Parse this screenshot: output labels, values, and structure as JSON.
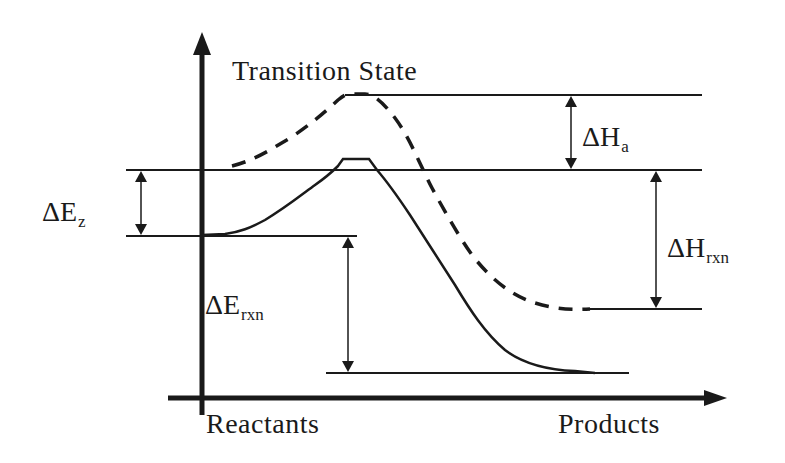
{
  "diagram": {
    "type": "energy-profile",
    "title_label": "Transition State",
    "x_axis": {
      "start_label": "Reactants",
      "end_label": "Products"
    },
    "labels": {
      "delta_e_z": {
        "base": "ΔE",
        "sub": "z"
      },
      "delta_h_a": {
        "base": "ΔH",
        "sub": "a"
      },
      "delta_h_rxn": {
        "base": "ΔH",
        "sub": "rxn"
      },
      "delta_e_rxn": {
        "base": "ΔE",
        "sub": "rxn"
      }
    },
    "curves": [
      {
        "name": "enthalpy-curve",
        "style": "dashed"
      },
      {
        "name": "energy-curve",
        "style": "solid"
      }
    ],
    "colors": {
      "ink": "#1a1a1a",
      "background": "#ffffff"
    }
  }
}
